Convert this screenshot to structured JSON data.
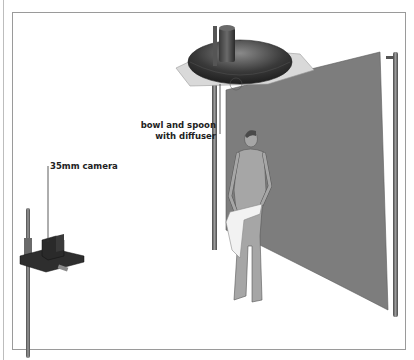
{
  "figure": {
    "type": "photography lighting setup illustration",
    "labels": {
      "bowl_line1": "bowl and spoon",
      "bowl_line2": "with diffuser",
      "camera": "35mm camera"
    },
    "elements": [
      "overhead bowl reflector with spoon and square diffuser on stand",
      "grey backdrop panel between two poles",
      "standing male figure holding towel",
      "35mm camera on platform mounted to vertical stand"
    ],
    "colors": {
      "backdrop": "#7d7d7d",
      "figure": "#a6a6a6",
      "bowl": "#3a3a3a",
      "diffuser": "#d9d9d9",
      "pole": "#6b6b6b",
      "camera": "#2e2e2e",
      "towel": "#f2f2f2",
      "frame": "#9a9a9a"
    }
  }
}
